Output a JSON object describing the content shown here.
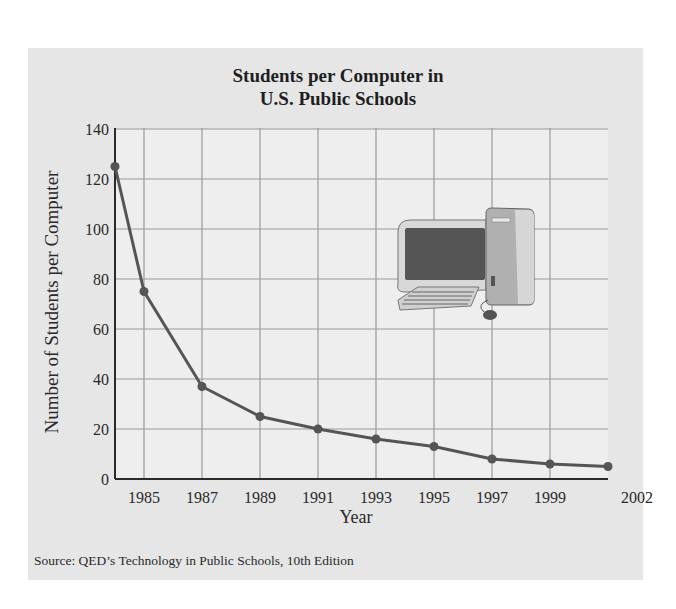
{
  "chart_data": {
    "type": "line",
    "title": "Students per Computer in U.S. Public Schools",
    "title_lines": [
      "Students per Computer in",
      "U.S. Public Schools"
    ],
    "xlabel": "Year",
    "ylabel": "Number of Students per Computer",
    "x": [
      1984,
      1985,
      1987,
      1989,
      1991,
      1993,
      1995,
      1997,
      1999,
      2002
    ],
    "values": [
      125,
      75,
      37,
      25,
      20,
      16,
      13,
      8,
      6,
      5
    ],
    "x_tick_labels": [
      "1985",
      "1987",
      "1989",
      "1991",
      "1993",
      "1995",
      "1997",
      "1999",
      "2002"
    ],
    "y_ticks": [
      0,
      20,
      40,
      60,
      80,
      100,
      120,
      140
    ],
    "ylim": [
      0,
      140
    ],
    "grid": true,
    "legend": null,
    "source": "Source: QED’s Technology in Public Schools, 10th Edition",
    "annotations": [
      "desktop computer illustration"
    ]
  },
  "colors": {
    "panel": "#e6e6e6",
    "plot_area": "#eeeeee",
    "grid": "#9a9a9a",
    "axis": "#2a2a2a",
    "line": "#555555",
    "marker": "#555555"
  }
}
